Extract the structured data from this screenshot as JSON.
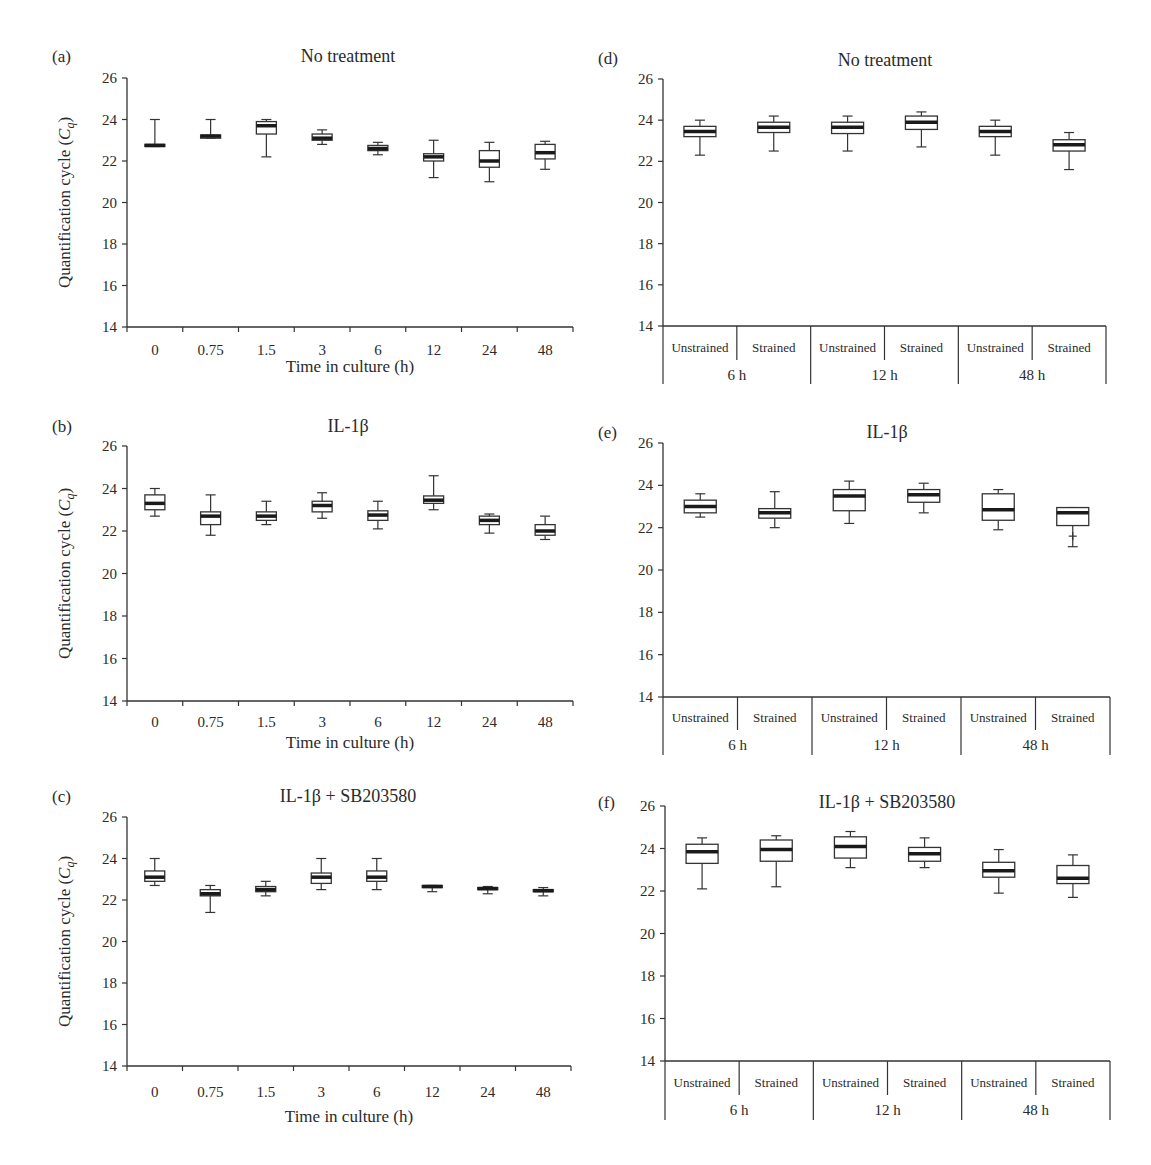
{
  "figure": {
    "ylabel": "Quantification cycle (Cq)",
    "ylabel_main": "Quantification cycle (",
    "ylabel_italic": "C",
    "ylabel_sub": "q",
    "ylabel_close": ")",
    "xlabel_time": "Time in culture (h)"
  },
  "chart_data": [
    {
      "id": "a",
      "panel_label": "(a)",
      "title": "No treatment",
      "type": "box",
      "xlabel": "Time in culture (h)",
      "ylabel": "Quantification cycle (Cq)",
      "ylim": [
        14,
        26
      ],
      "yticks": [
        14,
        16,
        18,
        20,
        22,
        24,
        26
      ],
      "categories": [
        "0",
        "0.75",
        "1.5",
        "3",
        "6",
        "12",
        "24",
        "48"
      ],
      "boxes": [
        {
          "min": 22.7,
          "q1": 22.7,
          "median": 22.75,
          "q3": 22.8,
          "max": 24.0
        },
        {
          "min": 23.1,
          "q1": 23.1,
          "median": 23.2,
          "q3": 23.25,
          "max": 24.0
        },
        {
          "min": 22.2,
          "q1": 23.3,
          "median": 23.7,
          "q3": 23.9,
          "max": 24.0
        },
        {
          "min": 22.8,
          "q1": 23.0,
          "median": 23.1,
          "q3": 23.3,
          "max": 23.5
        },
        {
          "min": 22.3,
          "q1": 22.5,
          "median": 22.6,
          "q3": 22.75,
          "max": 22.9
        },
        {
          "min": 21.2,
          "q1": 22.0,
          "median": 22.2,
          "q3": 22.35,
          "max": 23.0
        },
        {
          "min": 21.0,
          "q1": 21.7,
          "median": 22.0,
          "q3": 22.5,
          "max": 22.9
        },
        {
          "min": 21.6,
          "q1": 22.1,
          "median": 22.4,
          "q3": 22.8,
          "max": 22.95
        }
      ]
    },
    {
      "id": "b",
      "panel_label": "(b)",
      "title": "IL-1β",
      "type": "box",
      "xlabel": "Time in culture (h)",
      "ylabel": "Quantification cycle (Cq)",
      "ylim": [
        14,
        26
      ],
      "yticks": [
        14,
        16,
        18,
        20,
        22,
        24,
        26
      ],
      "categories": [
        "0",
        "0.75",
        "1.5",
        "3",
        "6",
        "12",
        "24",
        "48"
      ],
      "boxes": [
        {
          "min": 22.7,
          "q1": 23.0,
          "median": 23.3,
          "q3": 23.7,
          "max": 24.0
        },
        {
          "min": 21.8,
          "q1": 22.3,
          "median": 22.7,
          "q3": 22.9,
          "max": 23.7
        },
        {
          "min": 22.3,
          "q1": 22.5,
          "median": 22.7,
          "q3": 22.9,
          "max": 23.4
        },
        {
          "min": 22.6,
          "q1": 22.9,
          "median": 23.2,
          "q3": 23.4,
          "max": 23.8
        },
        {
          "min": 22.1,
          "q1": 22.5,
          "median": 22.75,
          "q3": 22.95,
          "max": 23.4
        },
        {
          "min": 23.0,
          "q1": 23.3,
          "median": 23.45,
          "q3": 23.65,
          "max": 24.6
        },
        {
          "min": 21.9,
          "q1": 22.3,
          "median": 22.5,
          "q3": 22.7,
          "max": 22.8
        },
        {
          "min": 21.6,
          "q1": 21.8,
          "median": 22.0,
          "q3": 22.3,
          "max": 22.7
        }
      ]
    },
    {
      "id": "c",
      "panel_label": "(c)",
      "title": "IL-1β + SB203580",
      "type": "box",
      "xlabel": "Time in culture (h)",
      "ylabel": "Quantification cycle (Cq)",
      "ylim": [
        14,
        26
      ],
      "yticks": [
        14,
        16,
        18,
        20,
        22,
        24,
        26
      ],
      "categories": [
        "0",
        "0.75",
        "1.5",
        "3",
        "6",
        "12",
        "24",
        "48"
      ],
      "boxes": [
        {
          "min": 22.7,
          "q1": 22.9,
          "median": 23.1,
          "q3": 23.4,
          "max": 24.0
        },
        {
          "min": 21.4,
          "q1": 22.2,
          "median": 22.3,
          "q3": 22.5,
          "max": 22.7
        },
        {
          "min": 22.2,
          "q1": 22.4,
          "median": 22.5,
          "q3": 22.65,
          "max": 22.9
        },
        {
          "min": 22.5,
          "q1": 22.8,
          "median": 23.1,
          "q3": 23.3,
          "max": 24.0
        },
        {
          "min": 22.5,
          "q1": 22.9,
          "median": 23.1,
          "q3": 23.4,
          "max": 24.0
        },
        {
          "min": 22.4,
          "q1": 22.6,
          "median": 22.65,
          "q3": 22.7,
          "max": 22.7
        },
        {
          "min": 22.3,
          "q1": 22.5,
          "median": 22.55,
          "q3": 22.6,
          "max": 22.65
        },
        {
          "min": 22.2,
          "q1": 22.4,
          "median": 22.45,
          "q3": 22.5,
          "max": 22.6
        }
      ]
    },
    {
      "id": "d",
      "panel_label": "(d)",
      "title": "No treatment",
      "type": "box",
      "ylabel": "",
      "ylim": [
        14,
        26
      ],
      "yticks": [
        14,
        16,
        18,
        20,
        22,
        24,
        26
      ],
      "categories": [
        "Unstrained",
        "Strained",
        "Unstrained",
        "Strained",
        "Unstrained",
        "Strained"
      ],
      "groups": [
        "6 h",
        "12 h",
        "48 h"
      ],
      "boxes": [
        {
          "min": 22.3,
          "q1": 23.2,
          "median": 23.45,
          "q3": 23.7,
          "max": 24.0
        },
        {
          "min": 22.5,
          "q1": 23.4,
          "median": 23.65,
          "q3": 23.9,
          "max": 24.2
        },
        {
          "min": 22.5,
          "q1": 23.35,
          "median": 23.65,
          "q3": 23.9,
          "max": 24.2
        },
        {
          "min": 22.7,
          "q1": 23.55,
          "median": 23.9,
          "q3": 24.2,
          "max": 24.4
        },
        {
          "min": 22.3,
          "q1": 23.2,
          "median": 23.45,
          "q3": 23.7,
          "max": 24.0
        },
        {
          "min": 21.6,
          "q1": 22.5,
          "median": 22.8,
          "q3": 23.05,
          "max": 23.4
        }
      ]
    },
    {
      "id": "e",
      "panel_label": "(e)",
      "title": "IL-1β",
      "type": "box",
      "ylabel": "",
      "ylim": [
        14,
        26
      ],
      "yticks": [
        14,
        16,
        18,
        20,
        22,
        24,
        26
      ],
      "categories": [
        "Unstrained",
        "Strained",
        "Unstrained",
        "Strained",
        "Unstrained",
        "Strained"
      ],
      "groups": [
        "6 h",
        "12 h",
        "48 h"
      ],
      "boxes": [
        {
          "min": 22.5,
          "q1": 22.7,
          "median": 23.0,
          "q3": 23.3,
          "max": 23.6
        },
        {
          "min": 22.0,
          "q1": 22.45,
          "median": 22.7,
          "q3": 22.9,
          "max": 23.7
        },
        {
          "min": 22.2,
          "q1": 22.8,
          "median": 23.5,
          "q3": 23.8,
          "max": 24.2
        },
        {
          "min": 22.7,
          "q1": 23.2,
          "median": 23.55,
          "q3": 23.8,
          "max": 24.1
        },
        {
          "min": 21.9,
          "q1": 22.35,
          "median": 22.85,
          "q3": 23.6,
          "max": 23.8
        },
        {
          "min": 21.1,
          "q1": 22.1,
          "median": 22.7,
          "q3": 22.95,
          "max": 22.95
        }
      ],
      "outliers": [
        {
          "index": 5,
          "value": 21.6
        }
      ]
    },
    {
      "id": "f",
      "panel_label": "(f)",
      "title": "IL-1β + SB203580",
      "type": "box",
      "ylabel": "",
      "ylim": [
        14,
        26
      ],
      "yticks": [
        14,
        16,
        18,
        20,
        22,
        24,
        26
      ],
      "categories": [
        "Unstrained",
        "Strained",
        "Unstrained",
        "Strained",
        "Unstrained",
        "Strained"
      ],
      "groups": [
        "6 h",
        "12 h",
        "48 h"
      ],
      "boxes": [
        {
          "min": 22.1,
          "q1": 23.3,
          "median": 23.85,
          "q3": 24.2,
          "max": 24.5
        },
        {
          "min": 22.2,
          "q1": 23.4,
          "median": 23.95,
          "q3": 24.4,
          "max": 24.6
        },
        {
          "min": 23.1,
          "q1": 23.55,
          "median": 24.1,
          "q3": 24.55,
          "max": 24.8
        },
        {
          "min": 23.1,
          "q1": 23.4,
          "median": 23.75,
          "q3": 24.05,
          "max": 24.5
        },
        {
          "min": 21.9,
          "q1": 22.65,
          "median": 22.95,
          "q3": 23.35,
          "max": 23.95
        },
        {
          "min": 21.7,
          "q1": 22.35,
          "median": 22.6,
          "q3": 23.2,
          "max": 23.7
        }
      ]
    }
  ]
}
